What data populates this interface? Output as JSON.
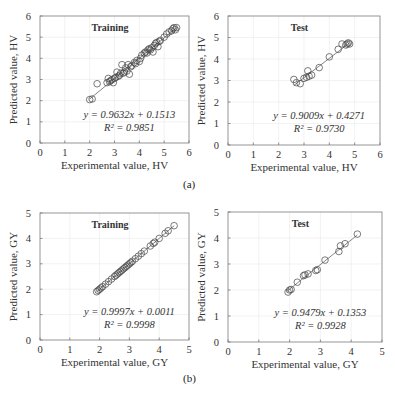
{
  "figure": {
    "captions": [
      "(a)",
      "(b)"
    ]
  },
  "chart_data": [
    {
      "id": "a-train",
      "type": "scatter",
      "title": "Training",
      "xlabel": "Experimental value, HV",
      "ylabel": "Predicted value, HV",
      "xlim": [
        0,
        6
      ],
      "ylim": [
        0,
        6
      ],
      "xticks": [
        0,
        1,
        2,
        3,
        4,
        5,
        6
      ],
      "yticks": [
        0,
        1,
        2,
        3,
        4,
        5,
        6
      ],
      "grid": true,
      "equation": "y = 0.9632x + 0.1513",
      "r2": "R² = 0.9851",
      "fit": {
        "slope": 0.9632,
        "intercept": 0.1513,
        "x_range": [
          2.0,
          5.5
        ]
      },
      "box": {
        "x0": 40,
        "y0": 16,
        "x1": 189,
        "y1": 143
      },
      "points": [
        [
          2.0,
          2.05
        ],
        [
          2.1,
          2.08
        ],
        [
          2.3,
          2.8
        ],
        [
          2.7,
          2.85
        ],
        [
          2.75,
          3.05
        ],
        [
          2.8,
          2.9
        ],
        [
          2.85,
          2.95
        ],
        [
          2.9,
          3.0
        ],
        [
          2.95,
          2.85
        ],
        [
          3.0,
          3.05
        ],
        [
          3.05,
          3.1
        ],
        [
          3.1,
          3.35
        ],
        [
          3.15,
          3.15
        ],
        [
          3.2,
          3.2
        ],
        [
          3.25,
          3.3
        ],
        [
          3.3,
          3.7
        ],
        [
          3.35,
          3.3
        ],
        [
          3.4,
          3.35
        ],
        [
          3.45,
          3.55
        ],
        [
          3.5,
          3.4
        ],
        [
          3.55,
          3.7
        ],
        [
          3.6,
          3.25
        ],
        [
          3.65,
          3.6
        ],
        [
          3.7,
          3.65
        ],
        [
          3.8,
          3.8
        ],
        [
          3.85,
          3.75
        ],
        [
          3.9,
          3.9
        ],
        [
          4.0,
          3.85
        ],
        [
          4.05,
          4.0
        ],
        [
          4.1,
          4.15
        ],
        [
          4.2,
          4.25
        ],
        [
          4.25,
          4.3
        ],
        [
          4.3,
          4.25
        ],
        [
          4.35,
          4.4
        ],
        [
          4.4,
          4.45
        ],
        [
          4.45,
          4.4
        ],
        [
          4.5,
          4.5
        ],
        [
          4.55,
          4.3
        ],
        [
          4.6,
          4.6
        ],
        [
          4.65,
          4.7
        ],
        [
          4.7,
          4.75
        ],
        [
          4.75,
          4.55
        ],
        [
          4.8,
          4.8
        ],
        [
          4.85,
          4.85
        ],
        [
          5.0,
          5.0
        ],
        [
          5.1,
          5.15
        ],
        [
          5.2,
          5.25
        ],
        [
          5.3,
          5.3
        ],
        [
          5.35,
          5.4
        ],
        [
          5.4,
          5.45
        ],
        [
          5.45,
          5.35
        ],
        [
          5.5,
          5.45
        ]
      ]
    },
    {
      "id": "a-test",
      "type": "scatter",
      "title": "Test",
      "xlabel": "Experimental value, HV",
      "ylabel": "Predicted value, HV",
      "xlim": [
        0,
        6
      ],
      "ylim": [
        0,
        6
      ],
      "xticks": [
        0,
        1,
        2,
        3,
        4,
        5,
        6
      ],
      "yticks": [
        0,
        1,
        2,
        3,
        4,
        5,
        6
      ],
      "grid": true,
      "equation": "y = 0.9009x + 0.4271",
      "r2": "R² = 0.9730",
      "fit": {
        "slope": 0.9009,
        "intercept": 0.4271,
        "x_range": [
          2.6,
          4.8
        ]
      },
      "box": {
        "x0": 228,
        "y0": 16,
        "x1": 380,
        "y1": 145
      },
      "points": [
        [
          2.6,
          3.05
        ],
        [
          2.7,
          2.9
        ],
        [
          2.85,
          2.85
        ],
        [
          3.0,
          3.1
        ],
        [
          3.1,
          3.15
        ],
        [
          3.15,
          3.45
        ],
        [
          3.2,
          3.2
        ],
        [
          3.3,
          3.25
        ],
        [
          3.6,
          3.6
        ],
        [
          4.0,
          4.1
        ],
        [
          4.35,
          4.45
        ],
        [
          4.5,
          4.7
        ],
        [
          4.65,
          4.65
        ],
        [
          4.7,
          4.7
        ],
        [
          4.75,
          4.75
        ],
        [
          4.8,
          4.7
        ]
      ]
    },
    {
      "id": "b-train",
      "type": "scatter",
      "title": "Training",
      "xlabel": "Experimental value, GY",
      "ylabel": "Predicted value, GY",
      "xlim": [
        0,
        5
      ],
      "ylim": [
        0,
        5
      ],
      "xticks": [
        0,
        1,
        2,
        3,
        4,
        5
      ],
      "yticks": [
        0,
        1,
        2,
        3,
        4,
        5
      ],
      "grid": true,
      "equation": "y = 0.9997x + 0.0011",
      "r2": "R² = 0.9998",
      "fit": {
        "slope": 0.9997,
        "intercept": 0.0011,
        "x_range": [
          1.9,
          4.5
        ]
      },
      "box": {
        "x0": 40,
        "y0": 213,
        "x1": 189,
        "y1": 340
      },
      "points": [
        [
          1.9,
          1.9
        ],
        [
          1.95,
          1.95
        ],
        [
          2.0,
          2.0
        ],
        [
          2.05,
          2.05
        ],
        [
          2.1,
          2.1
        ],
        [
          2.2,
          2.2
        ],
        [
          2.3,
          2.3
        ],
        [
          2.4,
          2.4
        ],
        [
          2.5,
          2.5
        ],
        [
          2.55,
          2.55
        ],
        [
          2.6,
          2.6
        ],
        [
          2.65,
          2.65
        ],
        [
          2.7,
          2.7
        ],
        [
          2.75,
          2.75
        ],
        [
          2.8,
          2.8
        ],
        [
          2.85,
          2.85
        ],
        [
          2.9,
          2.9
        ],
        [
          2.95,
          2.95
        ],
        [
          3.0,
          3.0
        ],
        [
          3.05,
          3.05
        ],
        [
          3.1,
          3.1
        ],
        [
          3.2,
          3.2
        ],
        [
          3.3,
          3.3
        ],
        [
          3.4,
          3.4
        ],
        [
          3.5,
          3.5
        ],
        [
          3.7,
          3.7
        ],
        [
          3.8,
          3.8
        ],
        [
          3.85,
          3.85
        ],
        [
          4.0,
          4.0
        ],
        [
          4.2,
          4.2
        ],
        [
          4.3,
          4.3
        ],
        [
          4.5,
          4.5
        ]
      ]
    },
    {
      "id": "b-test",
      "type": "scatter",
      "title": "Test",
      "xlabel": "Experimental value, GY",
      "ylabel": "Predicted value, GY",
      "xlim": [
        0,
        5
      ],
      "ylim": [
        0,
        5
      ],
      "xticks": [
        0,
        1,
        2,
        3,
        4,
        5
      ],
      "yticks": [
        0,
        1,
        2,
        3,
        4,
        5
      ],
      "grid": true,
      "equation": "y = 0.9479x + 0.1353",
      "r2": "R² = 0.9928",
      "fit": {
        "slope": 0.9479,
        "intercept": 0.1353,
        "x_range": [
          1.9,
          4.2
        ]
      },
      "box": {
        "x0": 228,
        "y0": 212,
        "x1": 382,
        "y1": 342
      },
      "points": [
        [
          1.95,
          1.92
        ],
        [
          2.0,
          2.0
        ],
        [
          2.05,
          2.02
        ],
        [
          2.25,
          2.3
        ],
        [
          2.45,
          2.55
        ],
        [
          2.5,
          2.58
        ],
        [
          2.6,
          2.62
        ],
        [
          2.85,
          2.75
        ],
        [
          2.9,
          2.78
        ],
        [
          3.15,
          3.15
        ],
        [
          3.6,
          3.48
        ],
        [
          3.65,
          3.7
        ],
        [
          3.8,
          3.78
        ],
        [
          4.2,
          4.15
        ]
      ]
    }
  ]
}
